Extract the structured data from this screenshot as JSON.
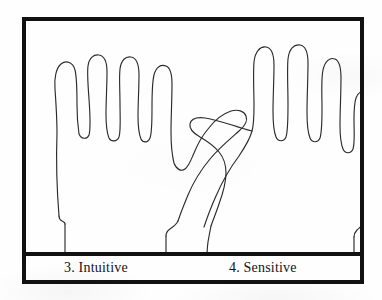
{
  "figure": {
    "kind": "hand-outline-tracings",
    "border_color": "#111111",
    "background_color": "#fefefe",
    "stroke_color": "#2b2b2b"
  },
  "captions": {
    "left": "3. Intuitive",
    "right": "4. Sensitive"
  },
  "hands": {
    "left": {
      "label": "left-hand-outline",
      "orientation": "palm-traced, thumb on right"
    },
    "right": {
      "label": "right-hand-outline",
      "orientation": "palm-traced, thumb on left"
    }
  }
}
